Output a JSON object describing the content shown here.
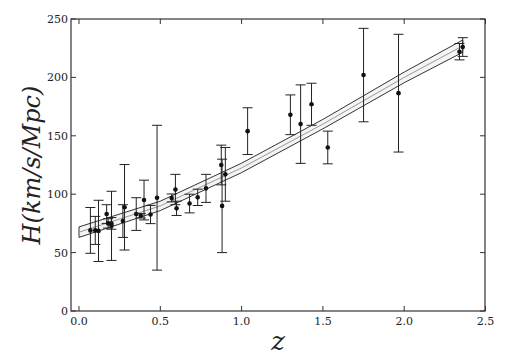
{
  "chart_data": {
    "type": "scatter",
    "title": "",
    "xlabel": "z",
    "ylabel": "H(km/s/Mpc)",
    "xlim": [
      -0.02,
      2.5
    ],
    "ylim": [
      0,
      250
    ],
    "xticks": [
      0.0,
      0.5,
      1.0,
      1.5,
      2.0,
      2.5
    ],
    "xtick_labels": [
      "0.0",
      "0.5",
      "1.0",
      "1.5",
      "2.0",
      "2.5"
    ],
    "yticks": [
      0,
      50,
      100,
      150,
      200,
      250
    ],
    "ytick_labels": [
      "0",
      "50",
      "100",
      "150",
      "200",
      "250"
    ],
    "grid": false,
    "legend": null,
    "series": [
      {
        "name": "H(z) observational data",
        "style": "errorbar",
        "points": [
          {
            "z": 0.07,
            "H": 69.0,
            "err": 19.6
          },
          {
            "z": 0.1,
            "H": 69.0,
            "err": 12.0
          },
          {
            "z": 0.12,
            "H": 68.6,
            "err": 26.2
          },
          {
            "z": 0.17,
            "H": 83.0,
            "err": 8.0
          },
          {
            "z": 0.179,
            "H": 75.0,
            "err": 4.0
          },
          {
            "z": 0.199,
            "H": 75.0,
            "err": 5.0
          },
          {
            "z": 0.2,
            "H": 72.9,
            "err": 29.6
          },
          {
            "z": 0.27,
            "H": 77.0,
            "err": 14.0
          },
          {
            "z": 0.28,
            "H": 88.8,
            "err": 36.6
          },
          {
            "z": 0.352,
            "H": 83.0,
            "err": 14.0
          },
          {
            "z": 0.38,
            "H": 81.5,
            "err": 1.9
          },
          {
            "z": 0.4,
            "H": 95.0,
            "err": 17.0
          },
          {
            "z": 0.44,
            "H": 82.6,
            "err": 7.8
          },
          {
            "z": 0.48,
            "H": 97.0,
            "err": 62.0
          },
          {
            "z": 0.57,
            "H": 96.8,
            "err": 3.4
          },
          {
            "z": 0.593,
            "H": 104.0,
            "err": 13.0
          },
          {
            "z": 0.6,
            "H": 87.9,
            "err": 6.1
          },
          {
            "z": 0.68,
            "H": 92.0,
            "err": 8.0
          },
          {
            "z": 0.73,
            "H": 97.3,
            "err": 7.0
          },
          {
            "z": 0.781,
            "H": 105.0,
            "err": 12.0
          },
          {
            "z": 0.875,
            "H": 125.0,
            "err": 17.0
          },
          {
            "z": 0.88,
            "H": 90.0,
            "err": 40.0
          },
          {
            "z": 0.9,
            "H": 117.0,
            "err": 23.0
          },
          {
            "z": 1.037,
            "H": 154.0,
            "err": 20.0
          },
          {
            "z": 1.3,
            "H": 168.0,
            "err": 17.0
          },
          {
            "z": 1.363,
            "H": 160.0,
            "err": 33.6
          },
          {
            "z": 1.43,
            "H": 177.0,
            "err": 18.0
          },
          {
            "z": 1.53,
            "H": 140.0,
            "err": 14.0
          },
          {
            "z": 1.75,
            "H": 202.0,
            "err": 40.0
          },
          {
            "z": 1.965,
            "H": 186.5,
            "err": 50.4
          },
          {
            "z": 2.34,
            "H": 222.0,
            "err": 7.0
          },
          {
            "z": 2.36,
            "H": 226.0,
            "err": 8.0
          }
        ]
      },
      {
        "name": "best-fit band",
        "style": "band",
        "x": [
          0.0,
          0.5,
          1.0,
          1.5,
          2.0,
          2.36
        ],
        "center": [
          67.5,
          90.0,
          122.5,
          160.0,
          200.0,
          227.0
        ],
        "upper": [
          72.0,
          94.0,
          126.5,
          164.0,
          204.5,
          232.0
        ],
        "lower": [
          63.0,
          86.0,
          118.5,
          156.0,
          195.5,
          221.5
        ]
      }
    ]
  }
}
